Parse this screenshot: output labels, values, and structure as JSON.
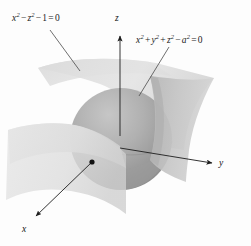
{
  "figure": {
    "name": "sphere-hyperbolic-cylinder-intersection",
    "background_color": "#fdfdfd",
    "width": 251,
    "height": 246
  },
  "labels": {
    "cylinder_equation": {
      "text": "x² − z² − 1 = 0",
      "terms": [
        "x",
        "2",
        "−",
        "z",
        "2",
        "−",
        "1",
        "=",
        "0"
      ],
      "x": 12,
      "y": 13
    },
    "sphere_equation": {
      "text": "x² + y² + z² − a² = 0",
      "terms": [
        "x",
        "2",
        "+",
        "y",
        "2",
        "+",
        "z",
        "2",
        "−",
        "a",
        "2",
        "=",
        "0"
      ],
      "x": 136,
      "y": 35
    }
  },
  "axes": {
    "z": {
      "label": "z",
      "x": 115,
      "y": 13,
      "direction": "up"
    },
    "y": {
      "label": "y",
      "x": 219,
      "y": 158,
      "direction": "right"
    },
    "x": {
      "label": "x",
      "x": 22,
      "y": 224,
      "direction": "down-left"
    },
    "origin_marker": {
      "x": 92,
      "y": 162,
      "color": "#111111"
    },
    "line_color": "#222222"
  },
  "surfaces": {
    "sphere": {
      "center_x": 121,
      "center_y": 139,
      "radius": 51,
      "fill_light": "#c9c9c9",
      "fill_dark": "#8e8e8e",
      "equation_ref": "sphere_equation"
    },
    "cylinder_sheet_upper": {
      "fill": "#dcdcdc",
      "equation_ref": "cylinder_equation"
    },
    "cylinder_sheet_lower": {
      "fill": "#e2e2e2",
      "equation_ref": "cylinder_equation"
    },
    "cylinder_sheet_right": {
      "fill": "#c4c4c4",
      "equation_ref": "cylinder_equation"
    }
  },
  "leader_lines": {
    "cylinder_leader": {
      "x1": 50,
      "y1": 30,
      "x2": 80,
      "y2": 71
    },
    "sphere_leader": {
      "x1": 169,
      "y1": 47,
      "x2": 139,
      "y2": 96
    },
    "color": "#4a4a4a"
  },
  "colors": {
    "background": "#fdfdfd",
    "ink": "#1b1b1b",
    "surface_light": "#e2e2e2",
    "surface_mid": "#cdcdcd",
    "surface_dark": "#9a9a9a"
  }
}
